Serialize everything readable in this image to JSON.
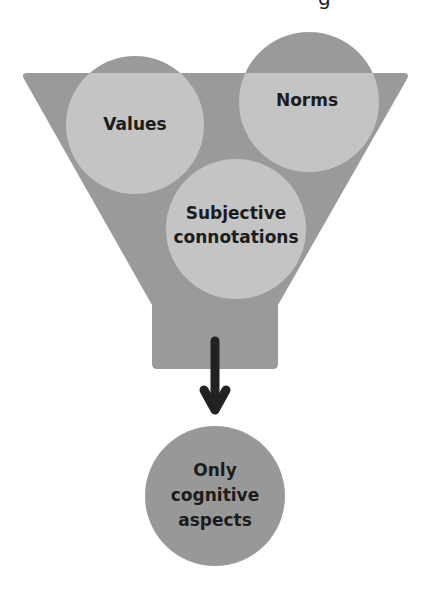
{
  "diagram": {
    "title_fragment": "g",
    "colors": {
      "funnel": "#9a9a9a",
      "circle_inside": "#c4c4c4",
      "circle_cap": "#9a9a9a",
      "output_circle": "#989898",
      "arrow": "#222222",
      "text": "#1c1c1c",
      "background": "#ffffff"
    },
    "funnel": {
      "label": "filter funnel",
      "inputs": [
        {
          "id": "values",
          "label": "Values"
        },
        {
          "id": "norms",
          "label": "Norms"
        },
        {
          "id": "subjective",
          "label": "Subjective\nconnotations"
        }
      ]
    },
    "arrow": {
      "direction": "down"
    },
    "output": {
      "label": "Only\ncognitive\naspects"
    }
  }
}
